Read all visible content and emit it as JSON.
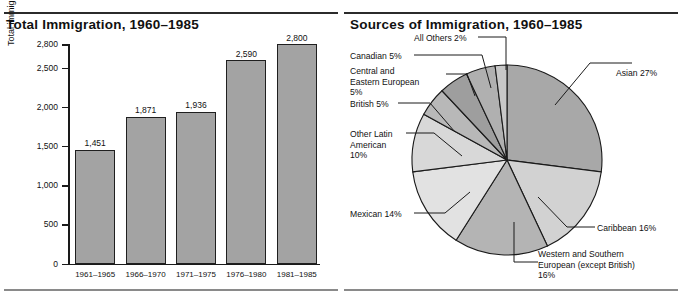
{
  "page": {
    "panels": [
      "bar-chart-panel",
      "pie-chart-panel"
    ]
  },
  "bar_panel": {
    "title": "Total Immigration, 1960–1985",
    "ylabel": "Total immigration during five-year periods (in thousands)"
  },
  "pie_panel": {
    "title": "Sources of Immigration, 1960–1985"
  },
  "chart_data": [
    {
      "type": "bar",
      "title": "Total Immigration, 1960–1985",
      "xlabel": "",
      "ylabel": "Total immigration during five-year periods (in thousands)",
      "categories": [
        "1961–1965",
        "1966–1970",
        "1971–1975",
        "1976–1980",
        "1981–1985"
      ],
      "values": [
        1451,
        1871,
        1936,
        2590,
        2800
      ],
      "value_labels": [
        "1,451",
        "1,871",
        "1,936",
        "2,590",
        "2,800"
      ],
      "ylim": [
        0,
        2800
      ],
      "yticks": [
        0,
        500,
        1000,
        1500,
        2000,
        2500,
        2800
      ],
      "ytick_labels": [
        "0",
        "500",
        "1,000",
        "1,500",
        "2,000",
        "2,500",
        "2,800"
      ],
      "grid": false,
      "legend": "none",
      "bar_color": "#a3a3a3",
      "bar_edge_color": "#1f1f1f"
    },
    {
      "type": "pie",
      "title": "Sources of Immigration, 1960–1985",
      "legend": "callout-labels",
      "start_angle_deg": 0,
      "direction": "clockwise",
      "slices": [
        {
          "label": "Asian 27%",
          "name": "Asian",
          "value": 27,
          "color": "#a8a8a8"
        },
        {
          "label": "Caribbean 16%",
          "name": "Caribbean",
          "value": 16,
          "color": "#d2d2d2"
        },
        {
          "label": "Western and Southern European (except British) 16%",
          "name": "Western and Southern European (except British)",
          "value": 16,
          "color": "#b4b4b4"
        },
        {
          "label": "Mexican 14%",
          "name": "Mexican",
          "value": 14,
          "color": "#e2e2e2"
        },
        {
          "label": "Other Latin American 10%",
          "name": "Other Latin American",
          "value": 10,
          "color": "#d8d8d8"
        },
        {
          "label": "British 5%",
          "name": "British",
          "value": 5,
          "color": "#b8b8b8"
        },
        {
          "label": "Central and Eastern European 5%",
          "name": "Central and Eastern European",
          "value": 5,
          "color": "#9e9e9e"
        },
        {
          "label": "Canadian 5%",
          "name": "Canadian",
          "value": 5,
          "color": "#b0b0b0"
        },
        {
          "label": "All Others 2%",
          "name": "All Others",
          "value": 2,
          "color": "#c8c8c8"
        }
      ]
    }
  ],
  "pie_labels": {
    "all_others": "All Others 2%",
    "canadian": "Canadian 5%",
    "central_eastern_l1": "Central and",
    "central_eastern_l2": "Eastern European",
    "central_eastern_l3": "5%",
    "british": "British 5%",
    "other_latin_l1": "Other Latin",
    "other_latin_l2": "American",
    "other_latin_l3": "10%",
    "mexican": "Mexican 14%",
    "asian": "Asian 27%",
    "caribbean": "Caribbean 16%",
    "western_l1": "Western and Southern",
    "western_l2": "European (except British)",
    "western_l3": "16%"
  }
}
